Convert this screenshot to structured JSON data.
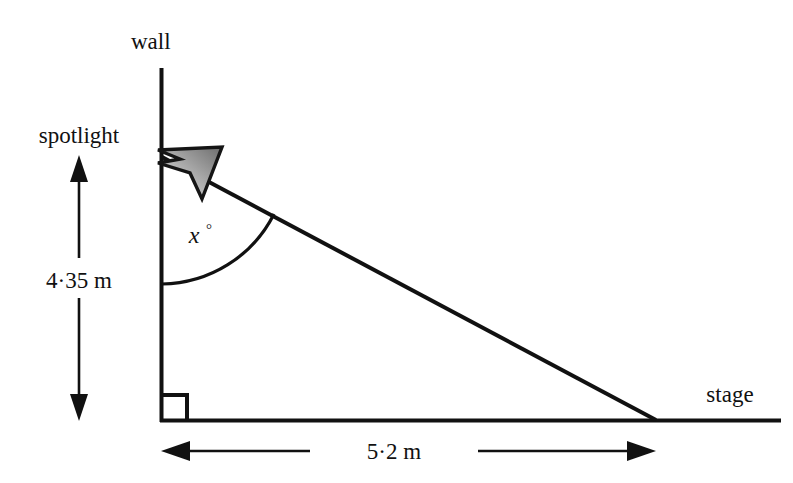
{
  "figure": {
    "title_visible": false,
    "background_color": "#ffffff",
    "ink_color": "#111111",
    "labels": {
      "wall": "wall",
      "spotlight": "spotlight",
      "stage": "stage",
      "vertical_dimension": "4·35 m",
      "horizontal_dimension": "5·2 m",
      "angle_variable": "x",
      "angle_degree_symbol": "°"
    },
    "measurements": {
      "wall_height_value": "4·35",
      "wall_height_unit": "m",
      "stage_length_value": "5·2",
      "stage_length_unit": "m",
      "unknown_angle": "x°"
    },
    "geometry": {
      "wall_top": [
        161,
        68
      ],
      "spotlight_point": [
        162,
        157
      ],
      "corner_right_angle": [
        162,
        420
      ],
      "stage_right_end": [
        780,
        420
      ],
      "beam_end_on_stage": [
        655,
        420
      ],
      "right_angle_marker_size": 25,
      "angle_arc_radius": 127,
      "vertical_arrow_x": 79,
      "vertical_arrow_top_y": 158,
      "vertical_arrow_bottom_y": 420,
      "horizontal_arrow_y": 451,
      "horizontal_arrow_left_x": 162,
      "horizontal_arrow_right_x": 655
    },
    "icons": {
      "spotlight": "spotlight-dart-icon",
      "vertical_dimension_arrow": "double-headed-vertical-arrow-icon",
      "horizontal_dimension_arrow": "double-headed-horizontal-arrow-icon",
      "right_angle": "right-angle-marker-icon"
    }
  }
}
